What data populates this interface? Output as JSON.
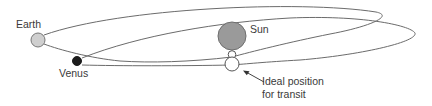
{
  "diagram": {
    "type": "transit-of-venus-orbits",
    "labels": {
      "earth": "Earth",
      "venus": "Venus",
      "sun": "Sun",
      "ideal_line1": "Ideal position",
      "ideal_line2": "for transit"
    },
    "colors": {
      "orbit_stroke": "#6b6b6b",
      "earth_fill": "#cfcfcf",
      "venus_fill": "#1c1c1c",
      "sun_fill": "#9a9a9a",
      "outline": "#555555",
      "text": "#3a3a3a"
    }
  }
}
